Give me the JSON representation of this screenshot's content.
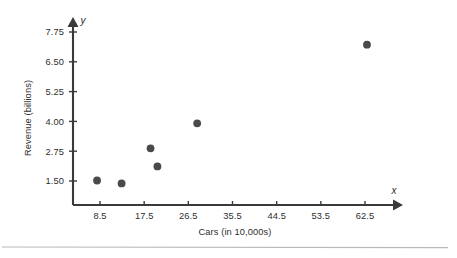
{
  "chart_data": {
    "type": "scatter",
    "title": "",
    "xlabel": "Cars (in 10,000s)",
    "ylabel": "Revenue (billions)",
    "x_axis_variable": "x",
    "y_axis_variable": "y",
    "xticks": [
      8.5,
      17.5,
      26.5,
      35.5,
      44.5,
      53.5,
      62.5
    ],
    "xtick_labels": [
      "8.5",
      "17.5",
      "26.5",
      "35.5",
      "44.5",
      "53.5",
      "62.5"
    ],
    "yticks": [
      1.5,
      2.75,
      4.0,
      5.25,
      6.5,
      7.75
    ],
    "ytick_labels": [
      "1.50",
      "2.75",
      "4.00",
      "5.25",
      "6.50",
      "7.75"
    ],
    "xlim": [
      4.0,
      69.0
    ],
    "ylim": [
      0.55,
      8.1
    ],
    "grid": false,
    "legend": null,
    "marker_color": "#4a4a4a",
    "axis_color": "#3a3a3a",
    "points": [
      {
        "x": 7.9,
        "y": 1.52
      },
      {
        "x": 12.9,
        "y": 1.4
      },
      {
        "x": 18.8,
        "y": 2.87
      },
      {
        "x": 20.2,
        "y": 2.11
      },
      {
        "x": 28.3,
        "y": 3.92
      },
      {
        "x": 62.9,
        "y": 7.22
      }
    ]
  },
  "figure": {
    "background_color": "#ffffff",
    "divider_color": "#b9b9bd"
  }
}
